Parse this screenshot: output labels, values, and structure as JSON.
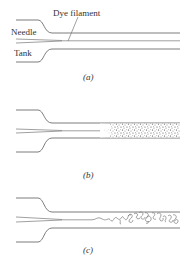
{
  "figure": {
    "panels": [
      {
        "id": "a",
        "caption": "(a)",
        "state": "laminar",
        "labels": {
          "needle": "Needle",
          "tank": "Tank",
          "dye": "Dye filament"
        }
      },
      {
        "id": "b",
        "caption": "(b)",
        "state": "turbulent-diffused"
      },
      {
        "id": "c",
        "caption": "(c)",
        "state": "transitional-eddies"
      }
    ],
    "colors": {
      "line": "#6e6e6e",
      "text": "#333333",
      "background": "#ffffff"
    }
  }
}
